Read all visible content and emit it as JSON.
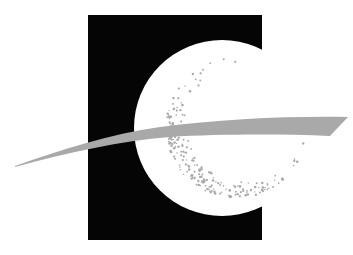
{
  "logo": {
    "colors": {
      "background": "#ffffff",
      "block": "#050505",
      "circle": "#ffffff",
      "stipple": "#a8a8a8",
      "swoosh": "#a9a9a9"
    },
    "block": {
      "x": 88,
      "y": 15,
      "width": 174,
      "height": 225
    },
    "circle": {
      "cx": 222,
      "cy": 128,
      "r": 88
    },
    "stipple_ring": {
      "cx": 236,
      "cy": 128,
      "outer_r": 70,
      "inner_cx": 246,
      "inner_r": 58
    },
    "swoosh_icon": "orbit-swoosh"
  }
}
